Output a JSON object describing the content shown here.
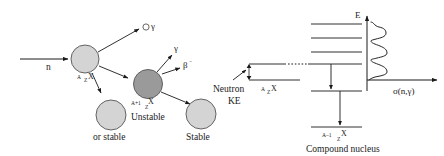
{
  "figure": {
    "background_color": "#ffffff",
    "stroke_color": "#1a1a1a"
  },
  "left_panel": {
    "incoming_particle_label": "n",
    "nuclei": [
      {
        "id": "target-nucleus",
        "fill_color": "#d4d4d4",
        "label_superscript": "A",
        "label_subscript": "Z",
        "label_element": "X",
        "caption": ""
      },
      {
        "id": "compound-nucleus",
        "fill_color": "#9a9a9a",
        "label_superscript": "A+1",
        "label_subscript": "Z",
        "label_element": "X",
        "caption": "Unstable"
      },
      {
        "id": "stable-product-nucleus",
        "fill_color": "#d4d4d4",
        "label_superscript": "",
        "label_subscript": "",
        "label_element": "",
        "caption": "or stable"
      },
      {
        "id": "final-stable-nucleus",
        "fill_color": "#d4d4d4",
        "label_superscript": "",
        "label_subscript": "",
        "label_element": "",
        "caption": "Stable"
      }
    ],
    "emissions": [
      {
        "id": "scatter-gamma",
        "label": "γ",
        "has_circle": true
      },
      {
        "id": "decay-gamma",
        "label": "γ",
        "has_circle": false
      },
      {
        "id": "beta-minus",
        "label": "β",
        "superscript": "−",
        "has_circle": false
      }
    ]
  },
  "right_panel": {
    "neutron_ke_label_line1": "Neutron",
    "neutron_ke_label_line2": "KE",
    "target_level_superscript": "A",
    "target_level_subscript": "Z",
    "target_level_element": "X",
    "ground_level_superscript": "A–1",
    "ground_level_subscript": "Z",
    "ground_level_element": "X",
    "compound_nucleus_caption": "Compound nucleus",
    "energy_axis_label": "E",
    "cross_section_label": "σ(n,γ)",
    "excited_levels_count": 4,
    "resonance_peaks": 4
  }
}
